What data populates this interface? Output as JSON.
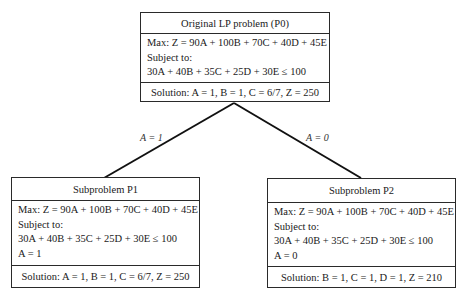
{
  "nodes": {
    "p0": {
      "title": "Original LP problem (P0)",
      "objective": "Max:  Z = 90A + 100B + 70C + 40D + 45E",
      "subject_to": "Subject to:",
      "constraint": "30A + 40B + 35C + 25D + 30E ≤ 100",
      "extra_constraint": "",
      "solution": "Solution:  A = 1, B = 1, C = 6/7, Z = 250"
    },
    "p1": {
      "title": "Subproblem P1",
      "objective": "Max:  Z = 90A + 100B + 70C + 40D + 45E",
      "subject_to": "Subject to:",
      "constraint": "30A + 40B + 35C + 25D + 30E ≤ 100",
      "extra_constraint": "A = 1",
      "solution": "Solution:  A = 1, B = 1, C = 6/7, Z = 250"
    },
    "p2": {
      "title": "Subproblem P2",
      "objective": "Max:  Z = 90A + 100B + 70C + 40D + 45E",
      "subject_to": "Subject to:",
      "constraint": "30A + 40B + 35C + 25D + 30E ≤ 100",
      "extra_constraint": "A = 0",
      "solution": "Solution:  B = 1, C = 1, D = 1, Z = 210"
    }
  },
  "edges": [
    {
      "from": "p0",
      "to": "p1",
      "label": "A = 1"
    },
    {
      "from": "p0",
      "to": "p2",
      "label": "A = 0"
    }
  ]
}
